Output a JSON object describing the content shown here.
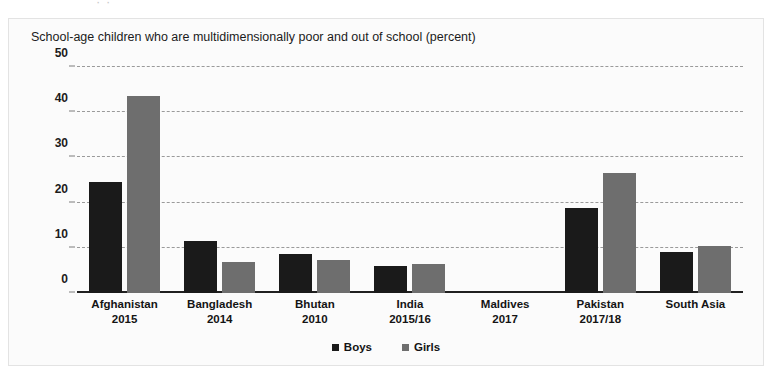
{
  "page_bleed_text": "·   ·",
  "figure": {
    "title": "School-age children who are multidimensionally poor and out of school (percent)"
  },
  "legend": {
    "position": "bottom-center",
    "items": [
      {
        "label": "Boys",
        "color": "#1a1a1a"
      },
      {
        "label": "Girls",
        "color": "#6e6e6e"
      }
    ]
  },
  "chart_data": {
    "type": "bar",
    "title": "School-age children who are multidimensionally poor and out of school (percent)",
    "xlabel": "",
    "ylabel": "",
    "ylim": [
      0,
      50
    ],
    "yticks": [
      0,
      10,
      20,
      30,
      40,
      50
    ],
    "grid": true,
    "grid_style": "dashed-horizontal",
    "categories": [
      "Afghanistan",
      "Bangladesh",
      "Bhutan",
      "India",
      "Maldives",
      "Pakistan",
      "South Asia"
    ],
    "category_years": [
      "2015",
      "2014",
      "2010",
      "2015/16",
      "2017",
      "2017/18",
      ""
    ],
    "series": [
      {
        "name": "Boys",
        "color": "#1a1a1a",
        "values": [
          24.5,
          11.6,
          8.6,
          6.0,
          0,
          18.9,
          9.0
        ]
      },
      {
        "name": "Girls",
        "color": "#6e6e6e",
        "values": [
          43.5,
          6.8,
          7.4,
          6.5,
          0,
          26.5,
          10.4
        ]
      }
    ]
  }
}
